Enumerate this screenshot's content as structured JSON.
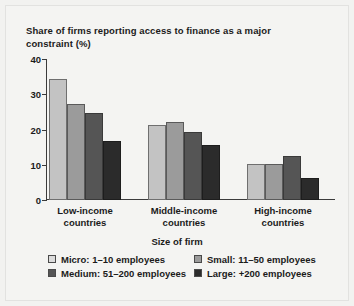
{
  "chart_data": {
    "type": "bar",
    "title": "Share of firms reporting access to finance as a major constraint (%)",
    "xlabel": "Size of firm",
    "ylabel": "",
    "ylim": [
      0,
      40
    ],
    "yticks": [
      0,
      10,
      20,
      30,
      40
    ],
    "grid": false,
    "legend_position": "bottom",
    "categories": [
      "Low-income countries",
      "Middle-income countries",
      "High-income countries"
    ],
    "category_lines": [
      [
        "Low-income",
        "countries"
      ],
      [
        "Middle-income",
        "countries"
      ],
      [
        "High-income",
        "countries"
      ]
    ],
    "series": [
      {
        "name": "Micro: 1–10 employees",
        "key": "micro",
        "color": "#c3c3c3",
        "legend_color": "#dcdcdc",
        "values": [
          34.3,
          21.2,
          10.3
        ]
      },
      {
        "name": "Small: 11–50 employees",
        "key": "small",
        "color": "#9b9b9b",
        "legend_color": "#9b9b9b",
        "values": [
          27.2,
          22.1,
          10.1
        ]
      },
      {
        "name": "Medium: 51–200 employees",
        "key": "medium",
        "color": "#555555",
        "legend_color": "#555555",
        "values": [
          24.6,
          19.2,
          12.5
        ]
      },
      {
        "name": "Large: +200 employees",
        "key": "large",
        "color": "#2b2b2b",
        "legend_color": "#2b2b2b",
        "values": [
          16.7,
          15.6,
          6.3
        ]
      }
    ]
  },
  "legend": {
    "title": "Size of firm",
    "rows": [
      [
        {
          "key": "micro",
          "label": "Micro: 1–10 employees"
        },
        {
          "key": "small",
          "label": "Small: 11–50 employees"
        }
      ],
      [
        {
          "key": "medium",
          "label": "Medium: 51–200 employees"
        },
        {
          "key": "large",
          "label": "Large: +200 employees"
        }
      ]
    ]
  }
}
